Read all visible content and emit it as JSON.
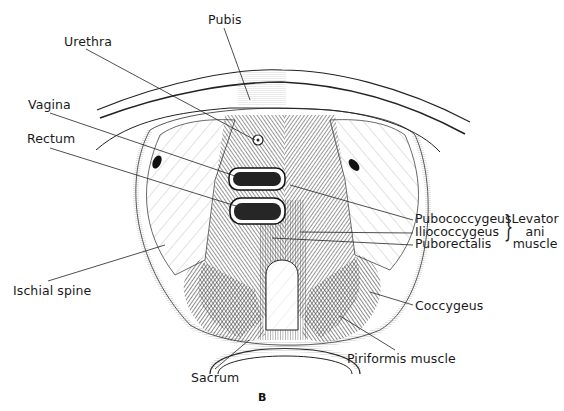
{
  "figure": {
    "panel_label": "B",
    "labels": {
      "pubis": "Pubis",
      "urethra": "Urethra",
      "vagina": "Vagina",
      "rectum": "Rectum",
      "ischial_spine": "Ischial spine",
      "sacrum": "Sacrum",
      "pubococcygeus": "Pubococcygeus",
      "iliococcygeus": "Iliococcygeus",
      "puborectalis": "Puborectalis",
      "coccygeus": "Coccygeus",
      "piriformis": "Piriformis muscle"
    },
    "group_label": {
      "line1": "Levator",
      "line2": "ani",
      "line3": "muscle"
    },
    "colors": {
      "ink": "#1a1a1a",
      "background": "#ffffff",
      "shade": "#6b6b6b"
    }
  }
}
